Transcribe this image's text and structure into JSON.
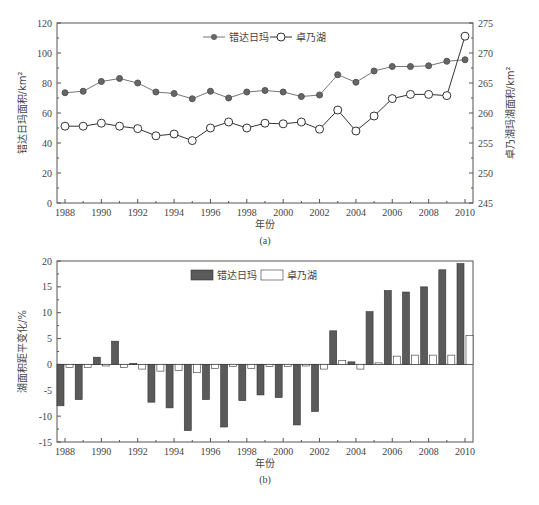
{
  "chart_data": [
    {
      "id": "a",
      "type": "line",
      "caption": "(a)",
      "xlabel": "年份",
      "ylabel": "错达日玛面积/km²",
      "ylabel_right": "卓乃湖玛湖面积/km²",
      "ylim": [
        0,
        120
      ],
      "ylim_right": [
        245,
        275
      ],
      "yticks": [
        0,
        20,
        40,
        60,
        80,
        100,
        120
      ],
      "yticks_right": [
        245,
        250,
        255,
        260,
        265,
        270,
        275
      ],
      "x": [
        1988,
        1989,
        1990,
        1991,
        1992,
        1993,
        1994,
        1995,
        1996,
        1997,
        1998,
        1999,
        2000,
        2001,
        2002,
        2003,
        2004,
        2005,
        2006,
        2007,
        2008,
        2009,
        2010
      ],
      "xticks": [
        1988,
        1990,
        1992,
        1994,
        1996,
        1998,
        2000,
        2002,
        2004,
        2006,
        2008,
        2010
      ],
      "legend_position": "top-center",
      "grid": false,
      "series": [
        {
          "name": "错达日玛",
          "axis": "left",
          "marker": "filled-circle",
          "color": "#666666",
          "values": [
            73.5,
            74.5,
            81,
            83,
            80,
            74,
            73,
            69.5,
            74.5,
            70,
            74,
            75,
            74,
            71,
            72,
            85.5,
            80.5,
            88,
            91,
            91,
            91.5,
            94.5,
            95.5
          ]
        },
        {
          "name": "卓乃湖",
          "axis": "right",
          "marker": "open-circle",
          "color": "#333333",
          "values": [
            257.8,
            257.8,
            258.3,
            257.8,
            257.4,
            256.2,
            256.5,
            255.4,
            257.5,
            258.5,
            257.5,
            258.3,
            258.2,
            258.5,
            257.3,
            260.5,
            257.0,
            259.5,
            262.4,
            263.1,
            263.1,
            262.9,
            272.8
          ]
        }
      ]
    },
    {
      "id": "b",
      "type": "bar",
      "caption": "(b)",
      "xlabel": "年份",
      "ylabel": "湖面积距平变化/%",
      "ylim": [
        -15,
        20
      ],
      "yticks": [
        -15,
        -10,
        -5,
        0,
        5,
        10,
        15,
        20
      ],
      "x": [
        1988,
        1989,
        1990,
        1991,
        1992,
        1993,
        1994,
        1995,
        1996,
        1997,
        1998,
        1999,
        2000,
        2001,
        2002,
        2003,
        2004,
        2005,
        2006,
        2007,
        2008,
        2009,
        2010
      ],
      "xticks": [
        1988,
        1990,
        1992,
        1994,
        1996,
        1998,
        2000,
        2002,
        2004,
        2006,
        2008,
        2010
      ],
      "legend_position": "top-center",
      "grid": false,
      "series": [
        {
          "name": "错达日玛",
          "fill": "#5a5a5a",
          "values": [
            -8.0,
            -6.8,
            1.4,
            4.5,
            0.2,
            -7.3,
            -8.4,
            -12.8,
            -6.8,
            -12.1,
            -7.0,
            -5.9,
            -6.4,
            -11.7,
            -9.1,
            6.5,
            0.5,
            10.2,
            14.3,
            14.0,
            15.0,
            18.3,
            19.5
          ]
        },
        {
          "name": "卓乃湖",
          "fill": "#ffffff",
          "values": [
            -0.6,
            -0.6,
            -0.3,
            -0.6,
            -0.9,
            -1.3,
            -1.2,
            -1.6,
            -0.8,
            -0.4,
            -0.8,
            -0.4,
            -0.4,
            -0.3,
            -0.9,
            0.8,
            -0.9,
            0.3,
            1.6,
            1.8,
            1.8,
            1.8,
            5.6
          ]
        }
      ]
    }
  ]
}
